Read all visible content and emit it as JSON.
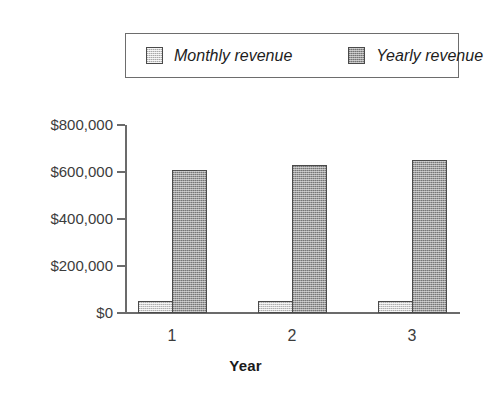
{
  "chart_data": {
    "type": "bar",
    "title": "",
    "subtitle": "",
    "xlabel": "Year",
    "ylabel": "",
    "categories": [
      "1",
      "2",
      "3"
    ],
    "series": [
      {
        "name": "Monthly revenue",
        "values": [
          52000,
          52000,
          52000
        ],
        "color": "#d4d4d4"
      },
      {
        "name": "Yearly revenue",
        "values": [
          608000,
          628000,
          652000
        ],
        "color": "#9d9d9d"
      }
    ],
    "ylim": [
      0,
      800000
    ],
    "ytick_values": [
      0,
      200000,
      400000,
      600000,
      800000
    ],
    "ytick_labels": [
      "$0",
      "$200,000",
      "$400,000",
      "$600,000",
      "$800,000"
    ],
    "xtick_labels": [
      "1",
      "2",
      "3"
    ],
    "grid": false,
    "legend_position": "top",
    "legend_entries": [
      "Monthly revenue",
      "Yearly revenue"
    ]
  },
  "legend": {
    "monthly": {
      "label": "Monthly revenue",
      "swatch": "light-hatched-swatch"
    },
    "yearly": {
      "label": "Yearly revenue",
      "swatch": "dark-hatched-swatch"
    }
  },
  "axes": {
    "x_title": "Year"
  },
  "colors": {
    "monthly_fill": "#d4d4d4",
    "yearly_fill": "#9d9d9d",
    "bar_outline": "#4a4a4a",
    "axis": "#6b6b6b",
    "text": "#3c3c3c",
    "background": "#ffffff"
  }
}
